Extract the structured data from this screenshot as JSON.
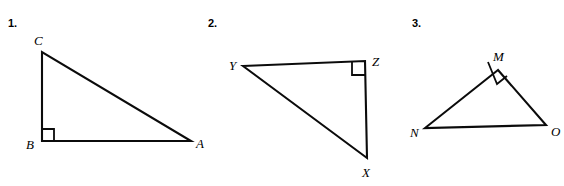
{
  "page": {
    "background_color": "#ffffff",
    "ink_color": "#0b0b0b",
    "width": 564,
    "height": 186
  },
  "problems": [
    {
      "number_label": "1.",
      "number_pos": {
        "x": 8,
        "y": 18
      },
      "figure_name": "right-triangle-abc",
      "vertices": [
        {
          "name": "C",
          "x": 42,
          "y": 52,
          "label_x": 34,
          "label_y": 34
        },
        {
          "name": "B",
          "x": 42,
          "y": 141,
          "label_x": 26,
          "label_y": 138
        },
        {
          "name": "A",
          "x": 191,
          "y": 141,
          "label_x": 196,
          "label_y": 137
        }
      ],
      "right_angle_at": "B",
      "right_angle_mark": {
        "size": 12,
        "points": "42,129 54,129 54,141"
      }
    },
    {
      "number_label": "2.",
      "number_pos": {
        "x": 208,
        "y": 18
      },
      "figure_name": "right-triangle-xyz",
      "vertices": [
        {
          "name": "Y",
          "x": 243,
          "y": 66,
          "label_x": 229,
          "label_y": 59
        },
        {
          "name": "Z",
          "x": 365,
          "y": 61,
          "label_x": 372,
          "label_y": 55
        },
        {
          "name": "X",
          "x": 367,
          "y": 158,
          "label_x": 362,
          "label_y": 166
        }
      ],
      "right_angle_at": "Z",
      "right_angle_mark": {
        "size": 13,
        "points": "352,62 352,75 365,75"
      }
    },
    {
      "number_label": "3.",
      "number_pos": {
        "x": 412,
        "y": 18
      },
      "figure_name": "right-triangle-mno",
      "vertices": [
        {
          "name": "M",
          "x": 498,
          "y": 70,
          "label_x": 493,
          "label_y": 50
        },
        {
          "name": "N",
          "x": 425,
          "y": 128,
          "label_x": 410,
          "label_y": 126
        },
        {
          "name": "O",
          "x": 546,
          "y": 125,
          "label_x": 551,
          "label_y": 125
        }
      ],
      "right_angle_at": "M",
      "right_angle_mark": {
        "size": 12,
        "points": "488,62 497,84 507,76"
      }
    }
  ]
}
